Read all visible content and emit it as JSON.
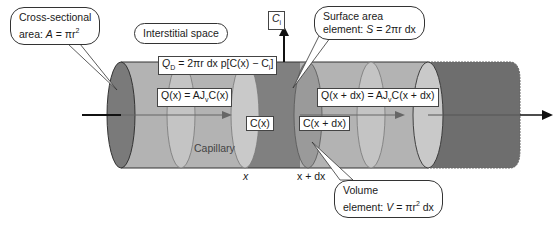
{
  "diagram": {
    "type": "capillary-cylinder-mass-balance",
    "colors": {
      "tube_light": "#b3b3b3",
      "tube_slice": "#c9c9c9",
      "tube_dark": "#808080",
      "tube_dark_end": "#6e6e6e",
      "outline": "#333333",
      "arrow": "#111111",
      "inner_arrow": "#6a6a6a",
      "background": "#ffffff"
    },
    "callouts": {
      "cross_section": {
        "line1": "Cross-sectional",
        "line2_prefix": "area: ",
        "var": "A",
        "eq": " = πr",
        "sup": "2"
      },
      "interstitial": {
        "label": "Interstitial space"
      },
      "surface_area": {
        "line1": "Surface area",
        "line2_prefix": "element: ",
        "var": "S",
        "eq": " = 2πr dx"
      },
      "volume": {
        "line1": "Volume",
        "line2_prefix": "element: ",
        "var": "V",
        "eq": " = πr",
        "sup": "2",
        "tail": " dx"
      }
    },
    "labels": {
      "ci": {
        "base": "C",
        "sub": "i"
      },
      "qd": {
        "base": "Q",
        "sub": "D",
        "rest": " = 2πr dx p[C(x) − C",
        "sub2": "i",
        "close": "]"
      },
      "qx": {
        "text": "Q(x) = AJ",
        "sub": "v",
        "tail": "C(x)"
      },
      "qxdx": {
        "text": "Q(x + dx) = AJ",
        "sub": "v",
        "tail": "C(x + dx)"
      },
      "cx": "C(x)",
      "cxdx": "C(x + dx)",
      "capillary": "Capillary",
      "x_pos": "x",
      "xdx_pos": "x + dx"
    }
  }
}
